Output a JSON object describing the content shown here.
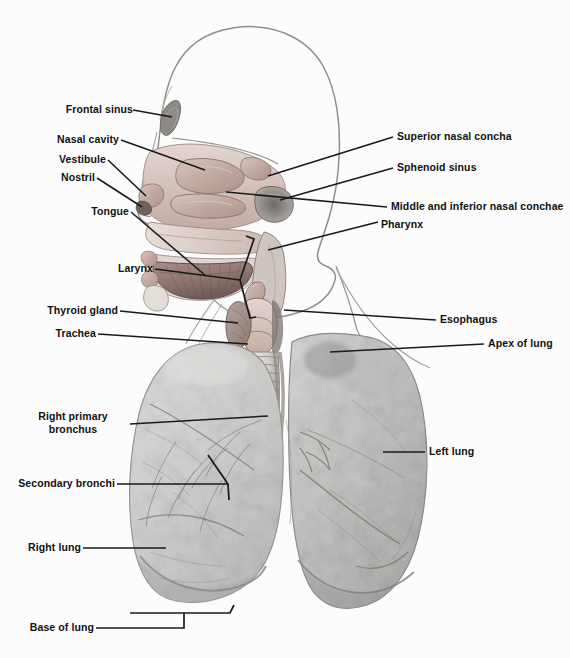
{
  "figure": {
    "background_color": "#fcfcfc",
    "label_color": "#111111",
    "leader_color": "#1a1a1a"
  },
  "labels": {
    "frontal_sinus": "Frontal sinus",
    "nasal_cavity": "Nasal cavity",
    "vestibule": "Vestibule",
    "nostril": "Nostril",
    "tongue": "Tongue",
    "larynx": "Larynx",
    "thyroid_gland": "Thyroid gland",
    "trachea": "Trachea",
    "right_primary_bronchus_line1": "Right primary",
    "right_primary_bronchus_line2": "bronchus",
    "secondary_bronchi": "Secondary bronchi",
    "right_lung": "Right lung",
    "base_of_lung": "Base of lung",
    "superior_nasal_concha": "Superior nasal concha",
    "sphenoid_sinus": "Sphenoid sinus",
    "middle_inferior_conchae": "Middle and inferior nasal conchae",
    "pharynx": "Pharynx",
    "esophagus": "Esophagus",
    "apex_of_lung": "Apex of lung",
    "left_lung": "Left lung"
  }
}
